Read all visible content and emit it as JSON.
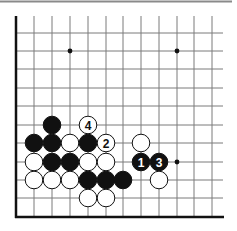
{
  "diagram": {
    "type": "go-board-corner",
    "grid": {
      "columns_x": [
        16,
        34,
        52,
        70,
        88,
        106,
        123,
        141,
        159,
        177,
        194,
        212
      ],
      "rows_y": [
        16,
        33,
        51,
        69,
        88,
        106,
        125,
        143,
        162,
        180,
        198,
        217
      ],
      "right_end_x": 223,
      "top_end_y": 16,
      "line_color": "#7a7a7a",
      "edge_color": "#111111"
    },
    "top_rule": {
      "y": 1.5,
      "x1": 0,
      "x2": 232,
      "color": "#8a8a8a"
    },
    "hoshi": [
      {
        "col": 3,
        "row": 2
      },
      {
        "col": 9,
        "row": 2
      },
      {
        "col": 9,
        "row": 8
      }
    ],
    "stones": [
      {
        "color": "black",
        "col": 2,
        "row": 6,
        "label": ""
      },
      {
        "color": "white",
        "col": 4,
        "row": 6,
        "label": "4"
      },
      {
        "color": "black",
        "col": 1,
        "row": 7,
        "label": ""
      },
      {
        "color": "black",
        "col": 2,
        "row": 7,
        "label": ""
      },
      {
        "color": "white",
        "col": 3,
        "row": 7,
        "label": ""
      },
      {
        "color": "black",
        "col": 4,
        "row": 7,
        "label": ""
      },
      {
        "color": "white",
        "col": 5,
        "row": 7,
        "label": "2"
      },
      {
        "color": "white",
        "col": 7,
        "row": 7,
        "label": ""
      },
      {
        "color": "white",
        "col": 1,
        "row": 8,
        "label": ""
      },
      {
        "color": "black",
        "col": 2,
        "row": 8,
        "label": ""
      },
      {
        "color": "black",
        "col": 3,
        "row": 8,
        "label": ""
      },
      {
        "color": "white",
        "col": 4,
        "row": 8,
        "label": ""
      },
      {
        "color": "white",
        "col": 5,
        "row": 8,
        "label": ""
      },
      {
        "color": "black",
        "col": 7,
        "row": 8,
        "label": "1"
      },
      {
        "color": "black",
        "col": 8,
        "row": 8,
        "label": "3"
      },
      {
        "color": "white",
        "col": 1,
        "row": 9,
        "label": ""
      },
      {
        "color": "white",
        "col": 2,
        "row": 9,
        "label": ""
      },
      {
        "color": "white",
        "col": 3,
        "row": 9,
        "label": ""
      },
      {
        "color": "black",
        "col": 4,
        "row": 9,
        "label": ""
      },
      {
        "color": "black",
        "col": 5,
        "row": 9,
        "label": ""
      },
      {
        "color": "black",
        "col": 6,
        "row": 9,
        "label": ""
      },
      {
        "color": "white",
        "col": 8,
        "row": 9,
        "label": ""
      },
      {
        "color": "white",
        "col": 4,
        "row": 10,
        "label": ""
      },
      {
        "color": "white",
        "col": 5,
        "row": 10,
        "label": ""
      }
    ],
    "move_labels": [
      "1",
      "2",
      "3",
      "4"
    ],
    "stone_radius": 8.8
  }
}
